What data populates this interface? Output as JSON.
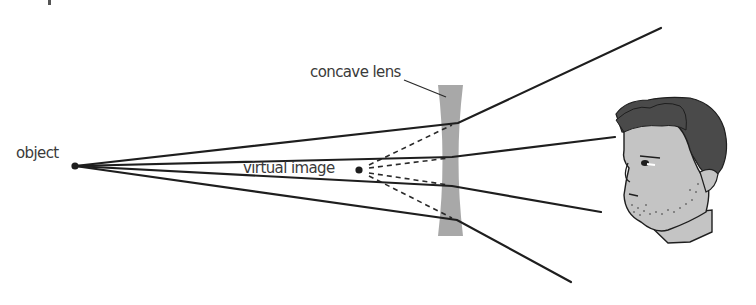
{
  "diagram": {
    "labels": {
      "object": "object",
      "lens": "concave lens",
      "virtual_image": "virtual image"
    },
    "colors": {
      "ray": "#1e1e1e",
      "lens_fill": "#a8a8a8",
      "skin": "#c4c4c4",
      "hair": "#4a4a4a",
      "text": "#3a3a3a"
    },
    "object_point": {
      "x": 75,
      "y": 166
    },
    "virtual_image_point": {
      "x": 359,
      "y": 170
    },
    "lens": {
      "x_left": 438,
      "x_right": 463,
      "y_top": 85,
      "y_bottom": 236,
      "waist_y": 160
    },
    "rays": [
      {
        "id": "ray-1",
        "from": [
          75,
          166
        ],
        "lens_hit": [
          458,
          123
        ],
        "to": [
          661,
          28
        ]
      },
      {
        "id": "ray-2",
        "from": [
          75,
          166
        ],
        "lens_hit": [
          452,
          157
        ],
        "to": [
          615,
          137
        ]
      },
      {
        "id": "ray-3",
        "from": [
          75,
          166
        ],
        "lens_hit": [
          452,
          186
        ],
        "to": [
          601,
          212
        ]
      },
      {
        "id": "ray-4",
        "from": [
          75,
          166
        ],
        "lens_hit": [
          457,
          220
        ],
        "to": [
          571,
          282
        ]
      }
    ],
    "observer": "eye-viewer-head"
  }
}
